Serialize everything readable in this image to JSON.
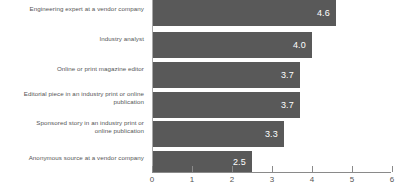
{
  "chart_data": {
    "type": "bar",
    "orientation": "horizontal",
    "title": "",
    "xlabel": "",
    "ylabel": "",
    "xlim": [
      0,
      6
    ],
    "xticks": [
      "0",
      "1",
      "2",
      "3",
      "4",
      "5",
      "6"
    ],
    "grid": false,
    "legend": null,
    "bar_color": "#595959",
    "value_label_color": "#ffffff",
    "categories": [
      "Engineering expert at a vendor company",
      "Industry analyst",
      "Online or print magazine editor",
      "Editorial piece in an industry print or online publication",
      "Sponsored story in an industry print or online publication",
      "Anonymous source at a vendor company"
    ],
    "category_lines": [
      [
        "Engineering expert at a vendor company"
      ],
      [
        "Industry analyst"
      ],
      [
        "Online or print magazine editor"
      ],
      [
        "Editorial piece in an industry print or online",
        "publication"
      ],
      [
        "Sponsored story in an industry print or",
        "online publication"
      ],
      [
        "Anonymous source at a vendor company"
      ]
    ],
    "values": [
      4.6,
      4.0,
      3.7,
      3.7,
      3.3,
      2.5
    ],
    "value_labels": [
      "4.6",
      "4.0",
      "3.7",
      "3.7",
      "3.3",
      "2.5"
    ]
  }
}
